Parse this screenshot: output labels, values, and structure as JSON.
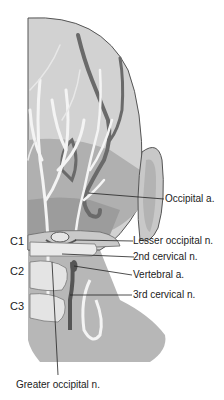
{
  "figure": {
    "colors": {
      "scalp": "#cfcfcf",
      "scalp_dark": "#a9a9a9",
      "neck": "#b7b7b7",
      "artery": "#6a6a6a",
      "nerve": "#f4f4f4",
      "outline": "#555555",
      "label_text": "#222222"
    },
    "labels": {
      "occipital_artery": "Occipital a.",
      "lesser_occipital_nerve": "Lesser occipital n.",
      "second_cervical_nerve": "2nd cervical n.",
      "vertebral_artery": "Vertebral a.",
      "third_cervical_nerve": "3rd cervical n.",
      "greater_occipital_nerve": "Greater occipital n."
    },
    "vertebral_levels": [
      "C1",
      "C2",
      "C3"
    ]
  }
}
